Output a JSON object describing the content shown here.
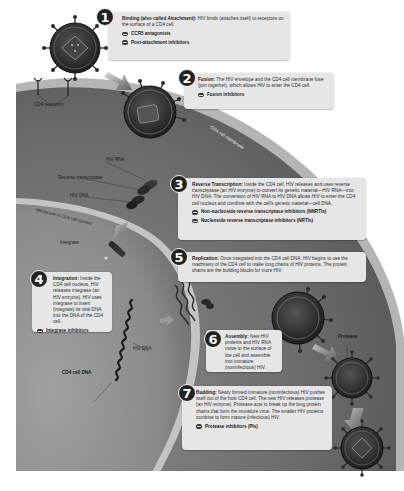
{
  "diagram": {
    "labels": {
      "cd4_receptors": "CD4 receptors",
      "cd4_cell_membrane": "CD4 cell membrane",
      "hiv_rna": "HIV RNA",
      "reverse_transcriptase": "Reverse transcriptase",
      "hiv_dna_top": "HIV DNA",
      "membrane_nucleus": "Membrane of CD4 cell nucleus",
      "integrase": "Integrase",
      "hiv_dna_bottom": "HIV DNA",
      "cd4_cell_dna": "CD4 cell DNA",
      "protease": "Protease"
    },
    "steps": [
      {
        "number": "1",
        "title": "Binding (also called Attachment):",
        "description": " HIV binds (attaches itself) to receptors on the surface of a CD4 cell.",
        "drugs": [
          "CCR5 antagonists",
          "Post-attachment inhibitors"
        ]
      },
      {
        "number": "2",
        "title": "Fusion:",
        "description": " The HIV envelope and the CD4 cell membrane fuse (join together), which allows HIV to enter the CD4 cell.",
        "drugs": [
          "Fusion inhibitors"
        ]
      },
      {
        "number": "3",
        "title": "Reverse Transcription:",
        "description": " Inside the CD4 cell, HIV releases and uses reverse transcriptase (an HIV enzyme) to convert its genetic material—HIV RNA—into HIV DNA. The conversion of HIV RNA to HIV DNA allows HIV to enter the CD4 cell nucleus and combine with the cell's genetic material—cell DNA.",
        "drugs": [
          "Non-nucleoside reverse transcriptase inhibitors (NNRTIs)",
          "Nucleoside reverse transcriptase inhibitors (NRTIs)"
        ]
      },
      {
        "number": "4",
        "title": "Integration:",
        "description": " Inside the CD4 cell nucleus, HIV releases integrase (an HIV enzyme). HIV uses integrase to insert (integrate) its viral DNA into the DNA of the CD4 cell.",
        "drugs": [
          "Integrase inhibitors"
        ]
      },
      {
        "number": "5",
        "title": "Replication:",
        "description": " Once integrated into the CD4 cell DNA, HIV begins to use the machinery of the CD4 cell to make long chains of HIV proteins. The protein chains are the building blocks for more HIV.",
        "drugs": []
      },
      {
        "number": "6",
        "title": "Assembly:",
        "description": " New HIV proteins and HIV RNA move to the surface of the cell and assemble into immature (noninfectious) HIV.",
        "drugs": []
      },
      {
        "number": "7",
        "title": "Budding:",
        "description": " Newly formed immature (noninfectious) HIV pushes itself out of the host CD4 cell. The new HIV releases protease (an HIV enzyme). Protease acts to break up the long protein chains that form the immature virus. The smaller HIV proteins combine to form mature (infectious) HIV.",
        "drugs": [
          "Protease inhibitors (PIs)"
        ]
      }
    ],
    "colors": {
      "background": "#ffffff",
      "cell_dark": "#5a5a5a",
      "cell_mid": "#7a7a7a",
      "membrane_light": "#b8b8b8",
      "nucleus": "#8c8c8c",
      "box_fill": "#e6e6e6",
      "number_badge": "#222222",
      "virus_dark": "#2a2a2a"
    }
  }
}
